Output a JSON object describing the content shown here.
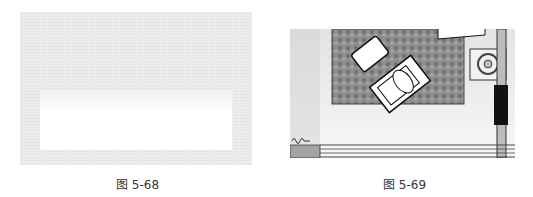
{
  "figures": [
    {
      "caption": "图 5-68",
      "description": "light gray dotted texture with white gradient rectangle"
    },
    {
      "caption": "图 5-69",
      "description": "floor plan with rug, lounge chair, ottoman, side table and wall section"
    }
  ]
}
